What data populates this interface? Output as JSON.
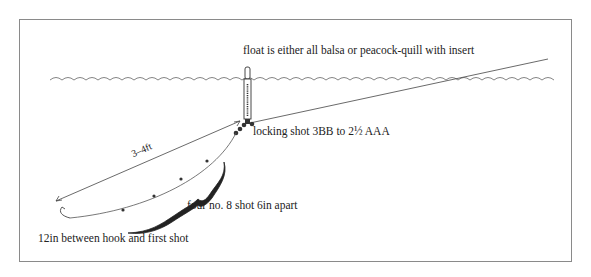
{
  "diagram": {
    "labels": {
      "float_note": "float is either all balsa or peacock-quill with insert",
      "locking_shot": "locking shot 3BB to 2½ AAA",
      "depth": "3–4ft",
      "dropper_shot": "four no. 8 shot 6in apart",
      "hook_gap": "12in between hook and first shot"
    },
    "elements": [
      {
        "name": "water-surface",
        "type": "wavy-line"
      },
      {
        "name": "float",
        "type": "vertical-quill"
      },
      {
        "name": "main-line",
        "type": "line",
        "from": "rod",
        "to": "float"
      },
      {
        "name": "locking-shot",
        "type": "shot-cluster",
        "count": 3
      },
      {
        "name": "tail-line",
        "type": "curve",
        "from": "float",
        "to": "hook"
      },
      {
        "name": "dropper-shot",
        "type": "shot",
        "count": 4
      },
      {
        "name": "hook",
        "type": "hook"
      },
      {
        "name": "depth-arrow",
        "type": "double-arrow"
      },
      {
        "name": "brace",
        "type": "curly-brace"
      }
    ],
    "colors": {
      "ink": "#222222",
      "frame": "#8a8a8a",
      "background": "#ffffff"
    }
  }
}
